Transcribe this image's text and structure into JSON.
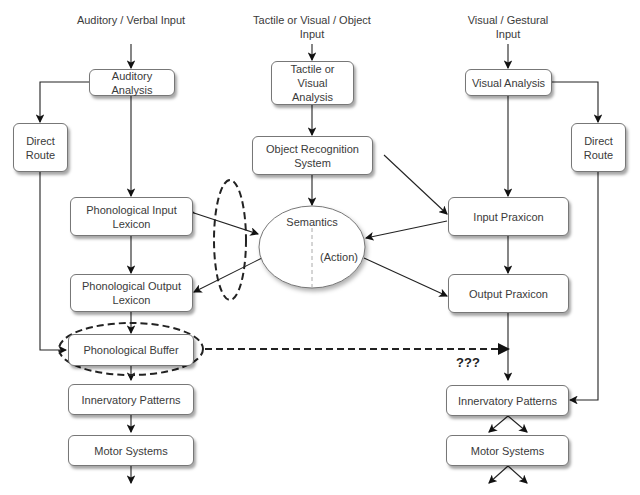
{
  "inputs": {
    "auditory": "Auditory / Verbal Input",
    "tactile": "Tactile or Visual / Object Input",
    "visual": "Visual / Gestural Input"
  },
  "left": {
    "auditory_analysis": "Auditory Analysis",
    "direct_route": "Direct Route",
    "phon_input_lexicon": "Phonological Input Lexicon",
    "phon_output_lexicon": "Phonological Output Lexicon",
    "phon_buffer": "Phonological Buffer",
    "innervatory": "Innervatory Patterns",
    "motor": "Motor Systems"
  },
  "center": {
    "tactile_analysis": "Tactile or Visual Analysis",
    "object_recognition": "Object Recognition System",
    "semantics": "Semantics",
    "action": "(Action)"
  },
  "right": {
    "visual_analysis": "Visual Analysis",
    "direct_route": "Direct Route",
    "input_praxicon": "Input Praxicon",
    "output_praxicon": "Output Praxicon",
    "innervatory": "Innervatory Patterns",
    "motor": "Motor Systems"
  },
  "annotations": {
    "unknown_link": "???"
  }
}
